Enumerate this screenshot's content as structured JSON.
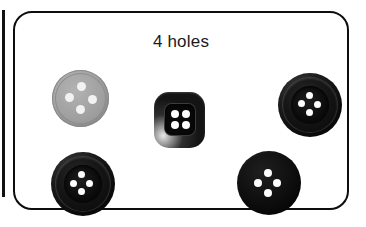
{
  "panel": {
    "title": "4 holes",
    "border_color": "#0d0d0d",
    "background_color": "#ffffff"
  },
  "edge_bar": {
    "name": "left-edge-divider",
    "color": "#111111"
  },
  "buttons": [
    {
      "id": "button-gray-round",
      "shape": "round",
      "color": "#a3a3a3",
      "hole_count": 4,
      "hole_arrangement": "diamond",
      "position": "top-left"
    },
    {
      "id": "button-square-dark",
      "shape": "square-rounded",
      "color": "#1a1a1a",
      "hole_count": 4,
      "hole_arrangement": "grid-2x2",
      "position": "center"
    },
    {
      "id": "button-black-rimmed-top-right",
      "shape": "round",
      "color": "#0a0a0a",
      "hole_count": 4,
      "hole_arrangement": "diamond",
      "position": "top-right"
    },
    {
      "id": "button-black-rimmed-bottom-left",
      "shape": "round",
      "color": "#0a0a0a",
      "hole_count": 4,
      "hole_arrangement": "diamond",
      "position": "bottom-left"
    },
    {
      "id": "button-black-flat-bottom-right",
      "shape": "round",
      "color": "#060606",
      "hole_count": 4,
      "hole_arrangement": "diamond",
      "position": "bottom-right"
    }
  ]
}
